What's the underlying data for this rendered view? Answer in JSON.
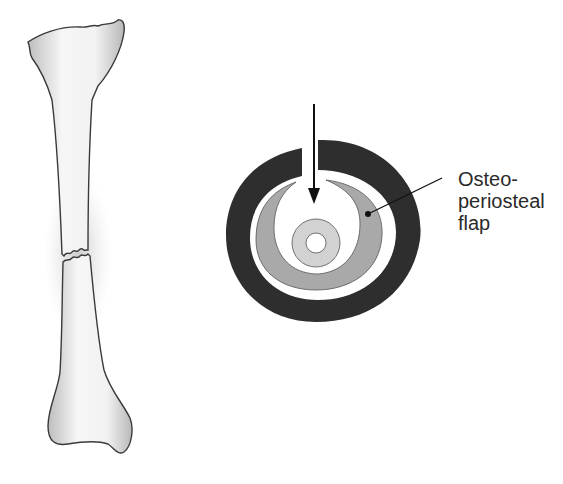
{
  "figure": {
    "left_panel": {
      "subject": "long bone with transverse shaft fracture and periosteal haze"
    },
    "right_panel": {
      "subject": "cross-section showing osteo-periosteal flap",
      "arrow": "down-arrow-through-cortex-gap",
      "label": {
        "line1": "Osteo-",
        "line2": "periosteal",
        "line3": "flap"
      }
    },
    "colors": {
      "outer_ring": "#2e2e2e",
      "flap": "#a9a9a9",
      "inner_disc": "#cfcfcf",
      "bone_fill": "#eeeeee",
      "bone_outline": "#3a3a3a"
    }
  }
}
